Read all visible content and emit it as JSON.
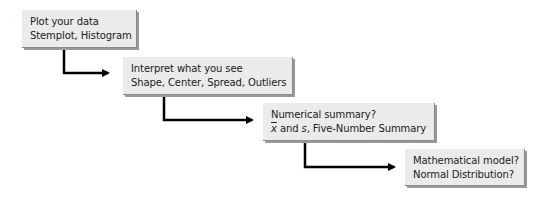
{
  "steps": [
    {
      "title": "Plot your data",
      "detail": "Stemplot, Histogram"
    },
    {
      "title": "Interpret what you see",
      "detail": "Shape, Center, Spread, Outliers"
    },
    {
      "title": "Numerical summary?",
      "detail_xbar": "x",
      "detail_and": " and ",
      "detail_s": "s",
      "detail_rest": ", Five-Number Summary"
    },
    {
      "title": "Mathematical model?",
      "detail": "Normal Distribution?"
    }
  ],
  "colors": {
    "box_fill": "#ebebeb",
    "box_shadow": "#9a9a9a",
    "arrow": "#000000"
  }
}
